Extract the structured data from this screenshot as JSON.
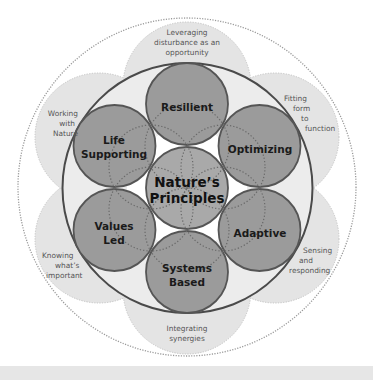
{
  "diagram": {
    "center": {
      "line1": "Nature’s",
      "line2": "Principles"
    },
    "principles": [
      {
        "id": "resilient",
        "line1": "Resilient",
        "line2": ""
      },
      {
        "id": "optimizing",
        "line1": "Optimizing",
        "line2": ""
      },
      {
        "id": "adaptive",
        "line1": "Adaptive",
        "line2": ""
      },
      {
        "id": "systems-based",
        "line1": "Systems",
        "line2": "Based"
      },
      {
        "id": "values-led",
        "line1": "Values",
        "line2": "Led"
      },
      {
        "id": "life-supporting",
        "line1": "Life",
        "line2": "Supporting"
      }
    ],
    "practices": [
      {
        "id": "leveraging-disturbance",
        "lines": [
          "Leveraging",
          "disturbance as an",
          "opportunity"
        ]
      },
      {
        "id": "fitting-form",
        "lines": [
          "Fitting",
          "form",
          "to",
          "function"
        ]
      },
      {
        "id": "sensing-responding",
        "lines": [
          "Sensing",
          "and",
          "responding"
        ]
      },
      {
        "id": "integrating-synergies",
        "lines": [
          "Integrating",
          "synergies"
        ]
      },
      {
        "id": "knowing-important",
        "lines": [
          "Knowing",
          "what’s",
          "important"
        ]
      },
      {
        "id": "working-with-nature",
        "lines": [
          "Working",
          "with",
          "Nature"
        ]
      }
    ],
    "colors": {
      "outer_petal_fill": "#e4e4e4",
      "outer_dotted": "#9a9a9a",
      "inner_ring_stroke": "#4a4a4a",
      "principle_fill": "#9b9b9b",
      "center_fill": "#a9a9a9",
      "principle_stroke": "#555555",
      "dotted_pattern": "#6a6a6a",
      "bottom_strip": "#e6e6e6"
    }
  }
}
